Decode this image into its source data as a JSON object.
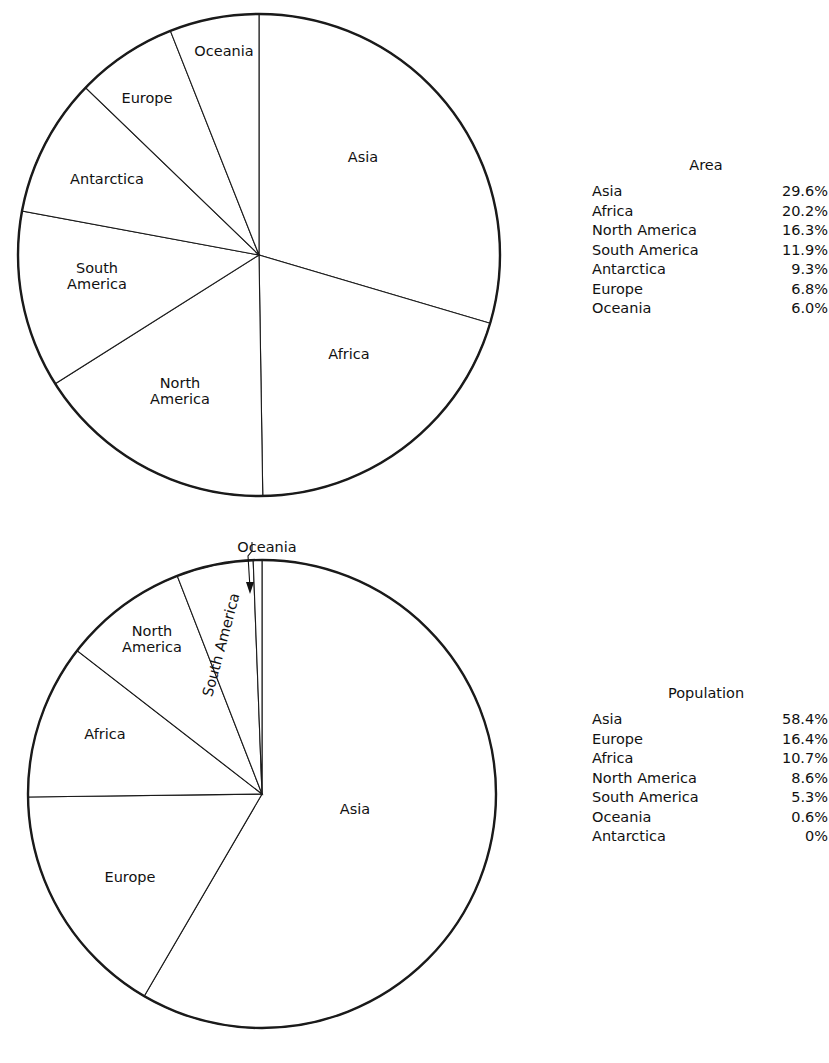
{
  "chart_data": [
    {
      "type": "pie",
      "title": "Area",
      "id": "area",
      "unit": "%",
      "start_angle_deg": 0,
      "direction": "clockwise",
      "center": {
        "x": 259,
        "y": 255
      },
      "radius": 241,
      "categories": [
        "Asia",
        "Africa",
        "North America",
        "South America",
        "Antarctica",
        "Europe",
        "Oceania"
      ],
      "values": [
        29.6,
        20.2,
        16.3,
        11.9,
        9.3,
        6.8,
        6.0
      ],
      "labels": [
        "29.6%",
        "20.2%",
        "16.3%",
        "11.9%",
        "9.3%",
        "6.8%",
        "6.0%"
      ],
      "slice_labels": [
        {
          "text": "Asia",
          "x": 363,
          "y": 158,
          "rotate": 0
        },
        {
          "text": "Africa",
          "x": 349,
          "y": 355,
          "rotate": 0
        },
        {
          "text": "North\nAmerica",
          "x": 180,
          "y": 392,
          "rotate": 0
        },
        {
          "text": "South\nAmerica",
          "x": 97,
          "y": 277,
          "rotate": 0
        },
        {
          "text": "Antarctica",
          "x": 107,
          "y": 180,
          "rotate": 0
        },
        {
          "text": "Europe",
          "x": 147,
          "y": 99,
          "rotate": 0
        },
        {
          "text": "Oceania",
          "x": 224,
          "y": 52,
          "rotate": 0
        }
      ]
    },
    {
      "type": "pie",
      "title": "Population",
      "id": "population",
      "unit": "%",
      "start_angle_deg": 0,
      "direction": "clockwise",
      "center": {
        "x": 262,
        "y": 794
      },
      "radius": 234,
      "categories": [
        "Asia",
        "Europe",
        "Africa",
        "North America",
        "South America",
        "Oceania",
        "Antarctica"
      ],
      "values": [
        58.4,
        16.4,
        10.7,
        8.6,
        5.3,
        0.6,
        0
      ],
      "labels": [
        "58.4%",
        "16.4%",
        "10.7%",
        "8.6%",
        "5.3%",
        "0.6%",
        "0%"
      ],
      "slice_labels": [
        {
          "text": "Asia",
          "x": 355,
          "y": 810,
          "rotate": 0
        },
        {
          "text": "Europe",
          "x": 130,
          "y": 878,
          "rotate": 0
        },
        {
          "text": "Africa",
          "x": 105,
          "y": 735,
          "rotate": 0
        },
        {
          "text": "North\nAmerica",
          "x": 152,
          "y": 640,
          "rotate": 0
        },
        {
          "text": "South America",
          "x": 222,
          "y": 645,
          "rotate": -75
        }
      ],
      "callout": {
        "text": "Oceania",
        "label_x": 267,
        "label_y": 548,
        "leader": "M 252 542 L 252 551 L 248 556 L 250 588",
        "arrow": "M 246 582 L 250 594 L 254 582 Z"
      }
    }
  ],
  "legends": {
    "area": {
      "title": "Area",
      "rows": [
        {
          "name": "Asia",
          "value": "29.6%"
        },
        {
          "name": "Africa",
          "value": "20.2%"
        },
        {
          "name": "North America",
          "value": "16.3%"
        },
        {
          "name": "South America",
          "value": "11.9%"
        },
        {
          "name": "Antarctica",
          "value": "9.3%"
        },
        {
          "name": "Europe",
          "value": "6.8%"
        },
        {
          "name": "Oceania",
          "value": "6.0%"
        }
      ]
    },
    "population": {
      "title": "Population",
      "rows": [
        {
          "name": "Asia",
          "value": "58.4%"
        },
        {
          "name": "Europe",
          "value": "16.4%"
        },
        {
          "name": "Africa",
          "value": "10.7%"
        },
        {
          "name": "North America",
          "value": "8.6%"
        },
        {
          "name": "South America",
          "value": "5.3%"
        },
        {
          "name": "Oceania",
          "value": "0.6%"
        },
        {
          "name": "Antarctica",
          "value": "0%"
        }
      ]
    }
  },
  "colors": {
    "background": "#ffffff",
    "stroke": "#1a1a1a",
    "text": "#111111"
  }
}
